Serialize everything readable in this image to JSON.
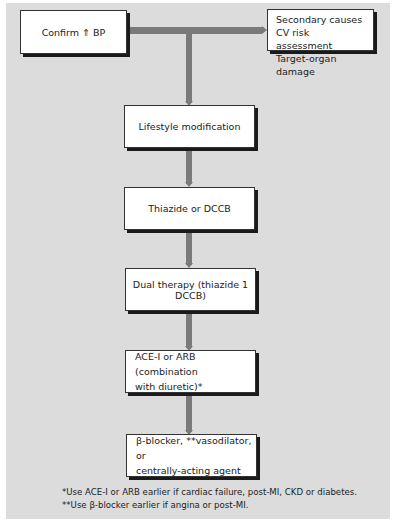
{
  "diagram": {
    "type": "flowchart",
    "start": {
      "label": "Confirm ⇑ BP"
    },
    "side_box": {
      "lines": [
        "Secondary causes",
        "CV risk assessment",
        "Target-organ damage"
      ]
    },
    "steps": [
      {
        "label": "Lifestyle modification"
      },
      {
        "label": "Thiazide or DCCB"
      },
      {
        "label": "Dual therapy (thiazide 1 DCCB)"
      },
      {
        "label_line1": "ACE-I or ARB (combination",
        "label_line2": "with diuretic)*"
      },
      {
        "label_line1": "β-blocker, **vasodilator, or",
        "label_line2": "centrally-acting agent"
      }
    ],
    "footnotes": [
      "*Use ACE-I or ARB earlier if cardiac failure, post-MI, CKD or diabetes.",
      "**Use β-blocker earlier if angina or post-MI."
    ],
    "colors": {
      "background": "#dcdcdc",
      "connector": "#7a7a7a",
      "box": "#ffffff",
      "shadow": "#1a1a1a"
    }
  }
}
